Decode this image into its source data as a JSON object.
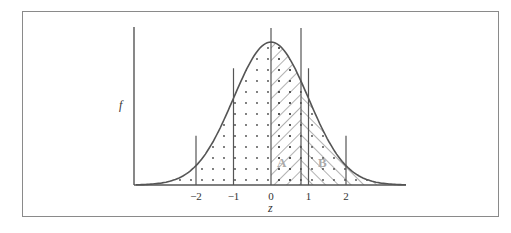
{
  "figure": {
    "y_axis_label": "f",
    "x_axis_label": "z",
    "tick_labels": [
      "−2",
      "−1",
      "0",
      "1",
      "2"
    ],
    "tick_values": [
      -2,
      -1,
      0,
      1,
      2
    ],
    "region_labels": [
      "A",
      "B"
    ],
    "marker_z": 0.8,
    "colors": {
      "line": "#555555",
      "region_label": "#aaaaaa",
      "border": "#8a8a8a"
    }
  },
  "chart_data": {
    "type": "area",
    "title": "",
    "xlabel": "z",
    "ylabel": "f",
    "xlim": [
      -3.6,
      3.6
    ],
    "ticks": [
      -2,
      -1,
      0,
      1,
      2
    ],
    "vertical_lines": [
      -2,
      -1,
      0,
      0.8,
      1,
      2
    ],
    "regions": [
      {
        "label": "A",
        "from": 0,
        "to": 0.8,
        "fill": "hatch-down-right"
      },
      {
        "label": "B",
        "from": 0.8,
        "to": 3.6,
        "fill": "hatch-up-right"
      },
      {
        "label": "",
        "from": -3.6,
        "to": 0.8,
        "fill": "dots"
      }
    ],
    "grid": false,
    "legend": false
  }
}
